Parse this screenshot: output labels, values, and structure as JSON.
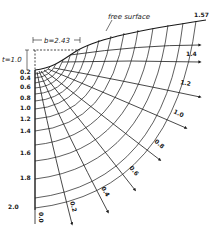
{
  "diagram": {
    "type": "flow-net",
    "title_annotation": "free surface",
    "dimension_b": "b=2.43",
    "dimension_t": "t=1.0",
    "left_axis_labels": [
      "0.2",
      "0.4",
      "0.6",
      "0.8",
      "1.0",
      "1.2",
      "1.4",
      "1.6",
      "1.8",
      "2.0"
    ],
    "streamline_labels": [
      "0.0",
      "0.2",
      "0.4",
      "0.6",
      "0.8",
      "1.0",
      "1.2",
      "1.4",
      "1.57"
    ],
    "colors": {
      "ink": "#1a1a1a",
      "background": "#ffffff"
    }
  }
}
